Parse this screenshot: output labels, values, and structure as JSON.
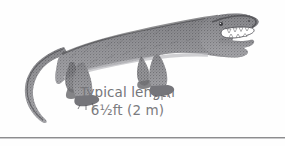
{
  "figure": {
    "subject_name": "archosaur-reptile-illustration",
    "subject_description": "Side view engraving of a crocodile-like archosaur facing right with open toothed jaws, four sprawling legs and a long curving tail",
    "orientation": "facing-right",
    "art_style": "stippled engraving",
    "ink_color": "#6f6f73",
    "shadow_color": "#9a9a9e",
    "tooth_color": "#ffffff",
    "background_color": "#fefefe"
  },
  "caption": {
    "label": "Typical length",
    "measurement": "6½ft (2 m)",
    "text_color": "#76767a"
  },
  "divider": {
    "name": "bottom-rule",
    "color": "#8d8d8f"
  }
}
